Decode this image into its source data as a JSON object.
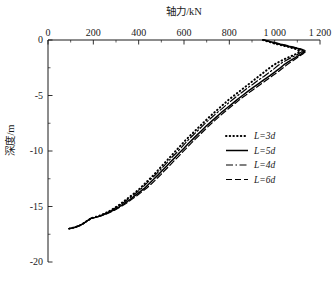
{
  "chart_data": {
    "type": "line",
    "title": "",
    "xlabel": "轴力/kN",
    "ylabel": "深度/m",
    "xlabel_position": "top",
    "xlim": [
      0,
      1200
    ],
    "ylim": [
      -20,
      0
    ],
    "xticks": [
      0,
      200,
      400,
      600,
      800,
      1000,
      1200
    ],
    "xtick_labels": [
      "0",
      "200",
      "400",
      "600",
      "800",
      "1 000",
      "1 200"
    ],
    "xminor_step": 100,
    "yticks": [
      0,
      -5,
      -10,
      -15,
      -20
    ],
    "ytick_labels": [
      "0",
      "-5",
      "-10",
      "-15",
      "-20"
    ],
    "yminor_step": 2.5,
    "grid": false,
    "legend_position": "center-right",
    "spines": [
      "top",
      "left"
    ],
    "series": [
      {
        "name": "L=3d",
        "label_prefix": "L",
        "label_suffix": "=3d",
        "style": "dotted",
        "color": "#000000",
        "width": 2.0,
        "dash": "0.5,3.2",
        "points": [
          [
            948,
            0.0
          ],
          [
            1005,
            -0.35
          ],
          [
            1060,
            -0.62
          ],
          [
            1098,
            -0.85
          ],
          [
            1112,
            -1.05
          ],
          [
            1090,
            -1.3
          ],
          [
            1062,
            -1.55
          ],
          [
            1035,
            -1.8
          ],
          [
            1012,
            -2.05
          ],
          [
            992,
            -2.3
          ],
          [
            972,
            -2.6
          ],
          [
            950,
            -2.95
          ],
          [
            928,
            -3.3
          ],
          [
            906,
            -3.65
          ],
          [
            884,
            -4.0
          ],
          [
            862,
            -4.35
          ],
          [
            840,
            -4.7
          ],
          [
            818,
            -5.05
          ],
          [
            796,
            -5.4
          ],
          [
            774,
            -5.8
          ],
          [
            752,
            -6.2
          ],
          [
            730,
            -6.6
          ],
          [
            708,
            -7.0
          ],
          [
            688,
            -7.4
          ],
          [
            668,
            -7.8
          ],
          [
            648,
            -8.2
          ],
          [
            628,
            -8.6
          ],
          [
            608,
            -9.0
          ],
          [
            590,
            -9.4
          ],
          [
            572,
            -9.8
          ],
          [
            554,
            -10.2
          ],
          [
            536,
            -10.6
          ],
          [
            518,
            -11.0
          ],
          [
            500,
            -11.4
          ],
          [
            482,
            -11.8
          ],
          [
            464,
            -12.2
          ],
          [
            444,
            -12.6
          ],
          [
            424,
            -13.0
          ],
          [
            404,
            -13.4
          ],
          [
            384,
            -13.75
          ],
          [
            362,
            -14.1
          ],
          [
            340,
            -14.45
          ],
          [
            318,
            -14.8
          ],
          [
            296,
            -15.1
          ],
          [
            272,
            -15.4
          ],
          [
            248,
            -15.65
          ],
          [
            224,
            -15.85
          ],
          [
            200,
            -16.0
          ],
          [
            186,
            -16.08
          ],
          [
            182,
            -16.18
          ],
          [
            172,
            -16.3
          ],
          [
            162,
            -16.45
          ],
          [
            150,
            -16.6
          ],
          [
            136,
            -16.75
          ],
          [
            120,
            -16.87
          ],
          [
            104,
            -16.95
          ],
          [
            92,
            -17.0
          ]
        ]
      },
      {
        "name": "L=5d",
        "label_prefix": "L",
        "label_suffix": "=5d",
        "style": "solid",
        "color": "#000000",
        "width": 1.5,
        "dash": "",
        "points": [
          [
            952,
            0.0
          ],
          [
            1012,
            -0.32
          ],
          [
            1070,
            -0.6
          ],
          [
            1112,
            -0.82
          ],
          [
            1132,
            -1.02
          ],
          [
            1118,
            -1.25
          ],
          [
            1098,
            -1.5
          ],
          [
            1078,
            -1.75
          ],
          [
            1058,
            -2.0
          ],
          [
            1040,
            -2.25
          ],
          [
            1022,
            -2.55
          ],
          [
            1000,
            -2.9
          ],
          [
            976,
            -3.25
          ],
          [
            952,
            -3.6
          ],
          [
            928,
            -3.95
          ],
          [
            904,
            -4.3
          ],
          [
            880,
            -4.65
          ],
          [
            858,
            -5.0
          ],
          [
            836,
            -5.35
          ],
          [
            812,
            -5.75
          ],
          [
            788,
            -6.15
          ],
          [
            764,
            -6.55
          ],
          [
            742,
            -6.95
          ],
          [
            720,
            -7.35
          ],
          [
            698,
            -7.75
          ],
          [
            678,
            -8.15
          ],
          [
            658,
            -8.55
          ],
          [
            638,
            -8.95
          ],
          [
            618,
            -9.35
          ],
          [
            600,
            -9.75
          ],
          [
            580,
            -10.15
          ],
          [
            562,
            -10.55
          ],
          [
            542,
            -10.95
          ],
          [
            524,
            -11.35
          ],
          [
            504,
            -11.75
          ],
          [
            486,
            -12.15
          ],
          [
            466,
            -12.55
          ],
          [
            446,
            -12.95
          ],
          [
            426,
            -13.35
          ],
          [
            404,
            -13.7
          ],
          [
            382,
            -14.05
          ],
          [
            360,
            -14.4
          ],
          [
            336,
            -14.75
          ],
          [
            312,
            -15.05
          ],
          [
            288,
            -15.35
          ],
          [
            262,
            -15.6
          ],
          [
            236,
            -15.82
          ],
          [
            210,
            -15.98
          ],
          [
            190,
            -16.06
          ],
          [
            184,
            -16.16
          ],
          [
            174,
            -16.28
          ],
          [
            163,
            -16.44
          ],
          [
            151,
            -16.59
          ],
          [
            137,
            -16.74
          ],
          [
            121,
            -16.86
          ],
          [
            105,
            -16.94
          ],
          [
            92,
            -17.0
          ]
        ]
      },
      {
        "name": "L=4d",
        "label_prefix": "L",
        "label_suffix": "=4d",
        "style": "dashdot",
        "color": "#000000",
        "width": 1.2,
        "dash": "7,2.5,1.5,2.5",
        "points": [
          [
            950,
            0.0
          ],
          [
            1008,
            -0.33
          ],
          [
            1065,
            -0.61
          ],
          [
            1105,
            -0.84
          ],
          [
            1122,
            -1.03
          ],
          [
            1104,
            -1.27
          ],
          [
            1080,
            -1.52
          ],
          [
            1056,
            -1.77
          ],
          [
            1034,
            -2.02
          ],
          [
            1016,
            -2.28
          ],
          [
            998,
            -2.58
          ],
          [
            976,
            -2.92
          ],
          [
            952,
            -3.28
          ],
          [
            928,
            -3.62
          ],
          [
            904,
            -3.98
          ],
          [
            880,
            -4.32
          ],
          [
            858,
            -4.68
          ],
          [
            836,
            -5.02
          ],
          [
            814,
            -5.38
          ],
          [
            790,
            -5.78
          ],
          [
            768,
            -6.18
          ],
          [
            744,
            -6.58
          ],
          [
            722,
            -6.98
          ],
          [
            700,
            -7.38
          ],
          [
            680,
            -7.78
          ],
          [
            660,
            -8.18
          ],
          [
            640,
            -8.58
          ],
          [
            620,
            -8.98
          ],
          [
            602,
            -9.38
          ],
          [
            584,
            -9.78
          ],
          [
            566,
            -10.18
          ],
          [
            546,
            -10.58
          ],
          [
            528,
            -10.98
          ],
          [
            510,
            -11.38
          ],
          [
            492,
            -11.78
          ],
          [
            472,
            -12.18
          ],
          [
            452,
            -12.58
          ],
          [
            432,
            -12.98
          ],
          [
            412,
            -13.38
          ],
          [
            392,
            -13.72
          ],
          [
            370,
            -14.07
          ],
          [
            348,
            -14.42
          ],
          [
            326,
            -14.77
          ],
          [
            302,
            -15.07
          ],
          [
            278,
            -15.37
          ],
          [
            254,
            -15.62
          ],
          [
            230,
            -15.83
          ],
          [
            206,
            -15.99
          ],
          [
            188,
            -16.07
          ],
          [
            183,
            -16.17
          ],
          [
            173,
            -16.29
          ],
          [
            162,
            -16.45
          ],
          [
            150,
            -16.6
          ],
          [
            136,
            -16.75
          ],
          [
            120,
            -16.86
          ],
          [
            104,
            -16.95
          ],
          [
            92,
            -17.0
          ]
        ]
      },
      {
        "name": "L=6d",
        "label_prefix": "L",
        "label_suffix": "=6d",
        "style": "dashed",
        "color": "#000000",
        "width": 1.2,
        "dash": "6,3",
        "points": [
          [
            955,
            0.0
          ],
          [
            1015,
            -0.31
          ],
          [
            1074,
            -0.59
          ],
          [
            1118,
            -0.81
          ],
          [
            1140,
            -1.0
          ],
          [
            1126,
            -1.23
          ],
          [
            1108,
            -1.48
          ],
          [
            1090,
            -1.73
          ],
          [
            1072,
            -1.98
          ],
          [
            1054,
            -2.23
          ],
          [
            1036,
            -2.53
          ],
          [
            1014,
            -2.88
          ],
          [
            990,
            -3.23
          ],
          [
            966,
            -3.58
          ],
          [
            942,
            -3.93
          ],
          [
            918,
            -4.28
          ],
          [
            894,
            -4.63
          ],
          [
            872,
            -4.98
          ],
          [
            848,
            -5.33
          ],
          [
            824,
            -5.73
          ],
          [
            800,
            -6.13
          ],
          [
            776,
            -6.53
          ],
          [
            754,
            -6.93
          ],
          [
            732,
            -7.33
          ],
          [
            710,
            -7.73
          ],
          [
            690,
            -8.13
          ],
          [
            670,
            -8.53
          ],
          [
            650,
            -8.93
          ],
          [
            630,
            -9.33
          ],
          [
            612,
            -9.73
          ],
          [
            592,
            -10.13
          ],
          [
            574,
            -10.53
          ],
          [
            554,
            -10.93
          ],
          [
            536,
            -11.33
          ],
          [
            516,
            -11.73
          ],
          [
            498,
            -12.13
          ],
          [
            478,
            -12.53
          ],
          [
            458,
            -12.93
          ],
          [
            436,
            -13.33
          ],
          [
            414,
            -13.68
          ],
          [
            392,
            -14.03
          ],
          [
            368,
            -14.38
          ],
          [
            344,
            -14.73
          ],
          [
            320,
            -15.03
          ],
          [
            294,
            -15.33
          ],
          [
            268,
            -15.58
          ],
          [
            240,
            -15.81
          ],
          [
            214,
            -15.97
          ],
          [
            192,
            -16.05
          ],
          [
            185,
            -16.15
          ],
          [
            175,
            -16.27
          ],
          [
            164,
            -16.43
          ],
          [
            152,
            -16.58
          ],
          [
            138,
            -16.73
          ],
          [
            122,
            -16.85
          ],
          [
            106,
            -16.94
          ],
          [
            93,
            -17.0
          ]
        ]
      }
    ]
  }
}
